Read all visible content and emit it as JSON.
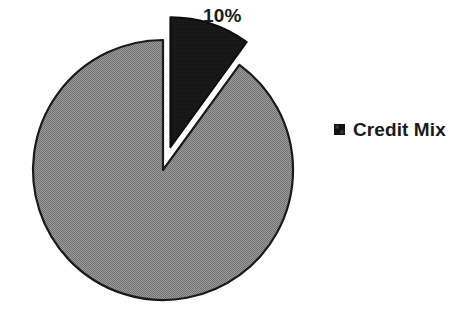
{
  "background_color": "#ffffff",
  "chart_data": {
    "type": "pie",
    "title": "",
    "subtitle": "",
    "xlabel": "",
    "ylabel": "",
    "grid": false,
    "legend_position": "right",
    "exploded_slice": "Credit Mix",
    "categories": [
      "Credit Mix",
      "Other"
    ],
    "values": [
      10,
      90
    ],
    "labels": [
      "10%",
      ""
    ],
    "colors": [
      "#111111",
      "#8a8a8a"
    ],
    "slices": [
      {
        "name": "Credit Mix",
        "value": 10,
        "label": "10%",
        "color": "#111111",
        "exploded": true,
        "in_legend": true
      },
      {
        "name": "Other",
        "value": 90,
        "label": "",
        "color": "#8a8a8a",
        "exploded": false,
        "in_legend": false
      }
    ],
    "legend": [
      {
        "label": "Credit Mix",
        "color": "#111111"
      }
    ]
  },
  "labels": {
    "credit_mix_pct": "10%"
  },
  "legend": {
    "items": [
      {
        "label": "Credit Mix",
        "color": "#111111"
      }
    ]
  },
  "colors": {
    "slice_black": "#111111",
    "slice_gray": "#8a8a8a",
    "outline": "#1a1a1a",
    "text": "#1a1a1a",
    "background": "#ffffff"
  }
}
